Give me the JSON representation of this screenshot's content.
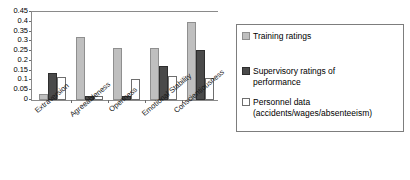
{
  "chart_data": {
    "type": "bar",
    "title": "",
    "subtitle": "",
    "xlabel": "",
    "ylabel": "",
    "ylim": [
      0,
      0.45
    ],
    "ytick_step": 0.05,
    "grid": false,
    "legend_position": "right",
    "categories": [
      "Extraversion",
      "Agreeableness",
      "Openness",
      "Emotional Stability",
      "Conscientiousness"
    ],
    "ytick_labels": [
      "0.45",
      "0.4",
      "0.35",
      "0.3",
      "0.25",
      "0.2",
      "0.15",
      "0.1",
      "0.05",
      "0"
    ],
    "ytick_values": [
      0.45,
      0.4,
      0.35,
      0.3,
      0.25,
      0.2,
      0.15,
      0.1,
      0.05,
      0
    ],
    "series": [
      {
        "name": "Training ratings",
        "color": "#bfbfbf",
        "values": [
          0.03,
          0.32,
          0.265,
          0.265,
          0.4
        ]
      },
      {
        "name": "Supervisory ratings of performance",
        "color": "#4a4a4a",
        "values": [
          0.14,
          0.02,
          0.02,
          0.175,
          0.255
        ]
      },
      {
        "name": "Personnel data (accidents/wages/absenteeism)",
        "color": "#ffffff",
        "values": [
          0.12,
          0.02,
          0.105,
          0.125,
          0.115
        ]
      }
    ]
  },
  "legend": {
    "items": [
      {
        "label": "Training ratings",
        "label2": ""
      },
      {
        "label": "Supervisory ratings of",
        "label2": "performance"
      },
      {
        "label": "Personnel data",
        "label2": "(accidents/wages/absenteeism)"
      }
    ]
  }
}
